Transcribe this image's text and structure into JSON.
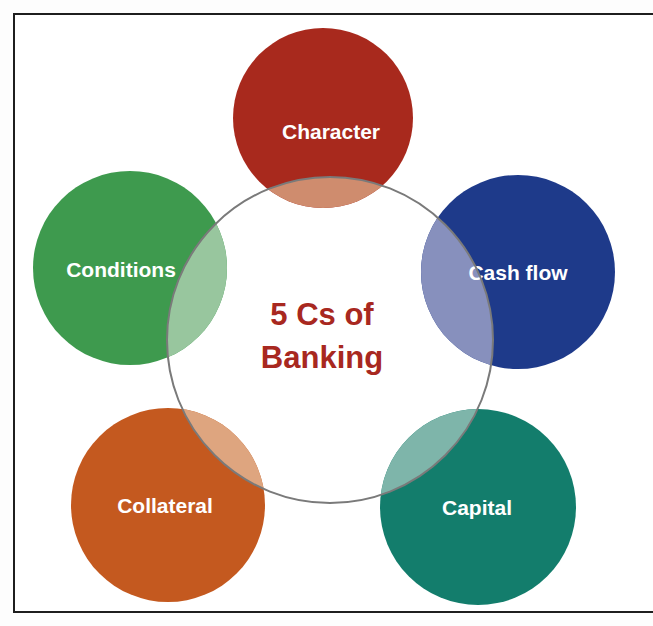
{
  "diagram": {
    "title_line1": "5 Cs of",
    "title_line2": "Banking",
    "title_color": "#a82820",
    "ring_color": "#7a7a7a",
    "circles": [
      {
        "label": "Character",
        "color": "#a8291d",
        "overlap_color": "#cf8c6e"
      },
      {
        "label": "Cash flow",
        "color": "#1e3a8a",
        "overlap_color": "#8790bd"
      },
      {
        "label": "Capital",
        "color": "#137d6c",
        "overlap_color": "#7eb5aa"
      },
      {
        "label": "Collateral",
        "color": "#c4591f",
        "overlap_color": "#dea57f"
      },
      {
        "label": "Conditions",
        "color": "#3e9a4e",
        "overlap_color": "#98c69e"
      }
    ]
  }
}
